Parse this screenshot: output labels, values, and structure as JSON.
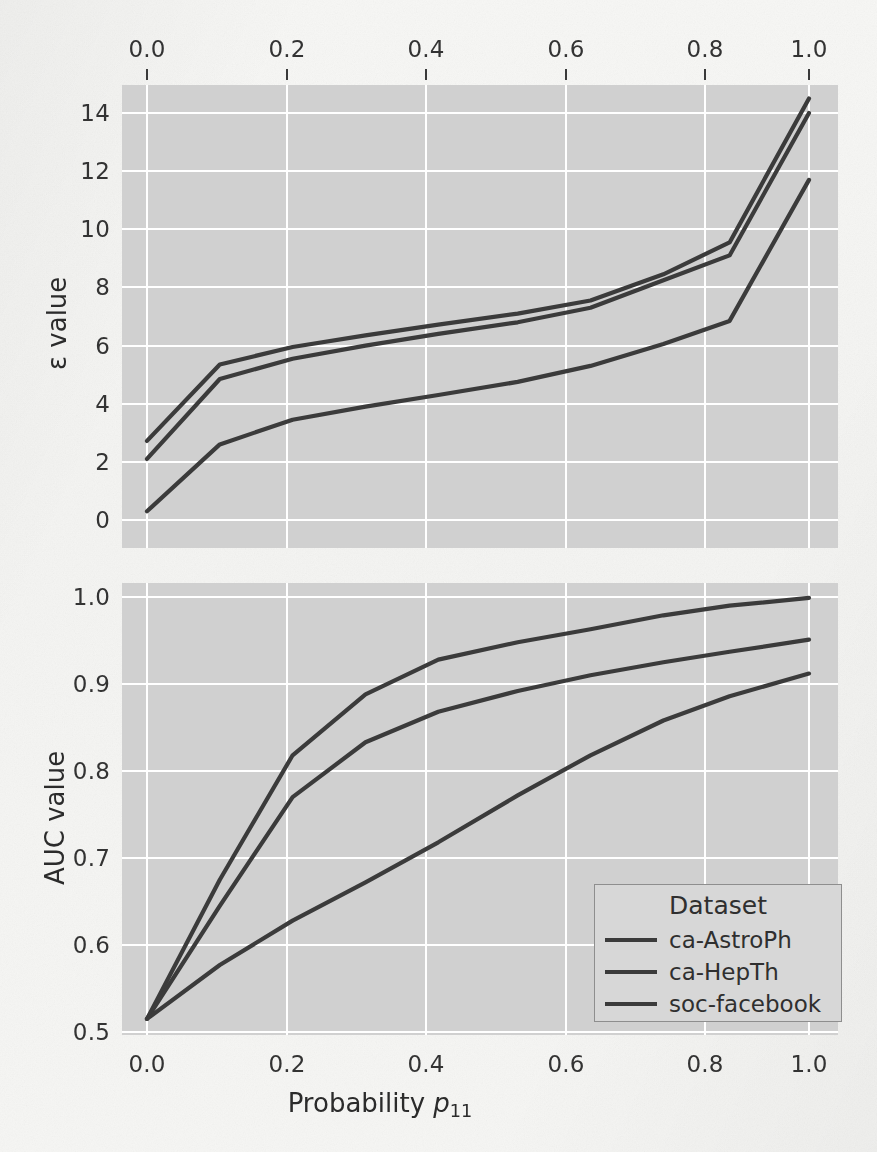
{
  "figure": {
    "background_color": "#f5f5f3",
    "axes_facecolor": "#d0d0d0",
    "grid_color": "#ffffff",
    "line_color": "#3b3b3b"
  },
  "top_panel": {
    "ylabel": "ε value",
    "y_ticks": [
      "14",
      "12",
      "10",
      "8",
      "6",
      "4",
      "2",
      "0"
    ],
    "x_ticks": [
      "0.0",
      "0.2",
      "0.4",
      "0.6",
      "0.8",
      "1.0"
    ],
    "x_axis_position": "top"
  },
  "bottom_panel": {
    "ylabel": "AUC value",
    "y_ticks": [
      "1.0",
      "0.9",
      "0.8",
      "0.7",
      "0.6",
      "0.5"
    ],
    "x_ticks": [
      "0.0",
      "0.2",
      "0.4",
      "0.6",
      "0.8",
      "1.0"
    ],
    "xlabel_prefix": "Probability ",
    "xlabel_symbol": "p",
    "xlabel_subscript": "11"
  },
  "legend": {
    "title": "Dataset",
    "entries": [
      {
        "label": "ca-AstroPh",
        "color": "#3b3b3b"
      },
      {
        "label": "ca-HepTh",
        "color": "#3b3b3b"
      },
      {
        "label": "soc-facebook",
        "color": "#3b3b3b"
      }
    ]
  },
  "chart_data": [
    {
      "type": "line",
      "panel": "top",
      "title": "",
      "xlabel": "Probability p_11",
      "ylabel": "ε value",
      "xlim": [
        -0.04,
        1.04
      ],
      "ylim": [
        -0.6,
        15.4
      ],
      "x_ticks": [
        0.0,
        0.2,
        0.4,
        0.6,
        0.8,
        1.0
      ],
      "y_ticks": [
        0,
        2,
        4,
        6,
        8,
        10,
        12,
        14
      ],
      "grid": true,
      "legend_position": "none",
      "x": [
        0.0,
        0.11,
        0.22,
        0.33,
        0.44,
        0.56,
        0.67,
        0.78,
        0.88,
        1.0
      ],
      "series": [
        {
          "name": "ca-AstroPh",
          "values": [
            2.72,
            5.35,
            5.95,
            6.35,
            6.72,
            7.1,
            7.55,
            8.45,
            9.55,
            14.5
          ]
        },
        {
          "name": "ca-HepTh",
          "values": [
            2.1,
            4.85,
            5.55,
            6.0,
            6.4,
            6.8,
            7.3,
            8.25,
            9.1,
            14.0
          ]
        },
        {
          "name": "soc-facebook",
          "values": [
            0.3,
            2.6,
            3.45,
            3.9,
            4.3,
            4.75,
            5.3,
            6.05,
            6.85,
            11.7
          ]
        }
      ]
    },
    {
      "type": "line",
      "panel": "bottom",
      "title": "",
      "xlabel": "Probability p_11",
      "ylabel": "AUC value",
      "xlim": [
        -0.04,
        1.04
      ],
      "ylim": [
        0.487,
        1.022
      ],
      "x_ticks": [
        0.0,
        0.2,
        0.4,
        0.6,
        0.8,
        1.0
      ],
      "y_ticks": [
        0.5,
        0.6,
        0.7,
        0.8,
        0.9,
        1.0
      ],
      "grid": true,
      "legend_position": "lower right",
      "x": [
        0.0,
        0.11,
        0.22,
        0.33,
        0.44,
        0.56,
        0.67,
        0.78,
        0.88,
        1.0
      ],
      "series": [
        {
          "name": "ca-AstroPh",
          "values": [
            0.515,
            0.675,
            0.818,
            0.888,
            0.928,
            0.948,
            0.963,
            0.979,
            0.99,
            0.999
          ]
        },
        {
          "name": "ca-HepTh",
          "values": [
            0.515,
            0.645,
            0.77,
            0.833,
            0.868,
            0.892,
            0.91,
            0.925,
            0.937,
            0.951
          ]
        },
        {
          "name": "soc-facebook",
          "values": [
            0.515,
            0.577,
            0.628,
            0.672,
            0.718,
            0.772,
            0.818,
            0.858,
            0.886,
            0.912
          ]
        }
      ]
    }
  ]
}
